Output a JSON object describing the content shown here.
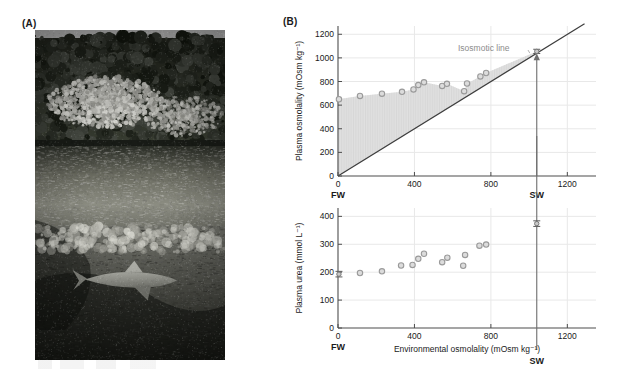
{
  "figure": {
    "panelA_label": "(A)",
    "panelB_label": "(B)"
  },
  "photo": {
    "alt_name": "bull-shark-in-mangrove-river-black-and-white-photograph",
    "scene": "Black and white photograph of a river lined with mangrove trees and palms, with a shark swimming below the water surface",
    "subject": "shark"
  },
  "chart_data": [
    {
      "id": "plasma-osmolality",
      "type": "scatter",
      "title": "",
      "xlabel": "",
      "ylabel": "Plasma osmolality (mOsm kg⁻¹)",
      "xlim": [
        0,
        1350
      ],
      "ylim": [
        0,
        1270
      ],
      "xticks": [
        0,
        400,
        800,
        1200
      ],
      "xticklabels": [
        "0",
        "400",
        "800",
        "1200"
      ],
      "yticks": [
        0,
        200,
        400,
        600,
        800,
        1000,
        1200
      ],
      "yticklabels": [
        "0",
        "200",
        "400",
        "600",
        "800",
        "1000",
        "1200"
      ],
      "grid": true,
      "legend": "none",
      "annotations": [
        {
          "text": "Isosmotic line",
          "x": 900,
          "y": 1075,
          "leader_to_x": 1035,
          "leader_to_y": 1040
        }
      ],
      "reference_lines": [
        {
          "name": "isosmotic-line",
          "type": "identity",
          "from": [
            0,
            0
          ],
          "to": [
            1290,
            1290
          ]
        }
      ],
      "shaded_region": {
        "name": "hyperosmotic-gap",
        "description": "Region between the isosmotic line and the measured plasma osmolality curve",
        "upper_x": [
          0,
          115,
          230,
          335,
          395,
          420,
          450,
          545,
          570,
          660,
          675,
          745,
          775,
          1040
        ],
        "upper_y": [
          650,
          678,
          697,
          713,
          733,
          770,
          793,
          763,
          780,
          718,
          783,
          843,
          872,
          1055
        ]
      },
      "series": [
        {
          "name": "Plasma osmolality",
          "x": [
            5,
            115,
            230,
            335,
            395,
            420,
            450,
            545,
            570,
            660,
            675,
            745,
            775
          ],
          "y": [
            650,
            678,
            697,
            713,
            733,
            770,
            793,
            763,
            780,
            718,
            783,
            843,
            872
          ]
        }
      ],
      "error_bar_points": [
        {
          "name": "SW-reference",
          "x": 1040,
          "y": 1055,
          "error": 18
        }
      ],
      "x_end_labels": [
        {
          "label": "FW",
          "x": 0
        },
        {
          "label": "SW",
          "x": 1040
        }
      ],
      "arrow": {
        "name": "sw-arrow",
        "x": 1040,
        "from_y": 0,
        "to_y": 1030
      }
    },
    {
      "id": "plasma-urea",
      "type": "scatter",
      "title": "",
      "xlabel": "Environmental osmolality (mOsm kg⁻¹)",
      "ylabel": "Plasma urea (mmol L⁻¹)",
      "xlim": [
        0,
        1350
      ],
      "ylim": [
        0,
        430
      ],
      "xticks": [
        0,
        400,
        800,
        1200
      ],
      "xticklabels": [
        "0",
        "400",
        "800",
        "1200"
      ],
      "yticks": [
        0,
        100,
        200,
        300,
        400
      ],
      "yticklabels": [
        "0",
        "100",
        "200",
        "300",
        "400"
      ],
      "grid": true,
      "legend": "none",
      "series": [
        {
          "name": "Plasma urea",
          "x": [
            115,
            230,
            330,
            390,
            420,
            450,
            545,
            572,
            655,
            665,
            740,
            775
          ],
          "y": [
            197,
            203,
            224,
            226,
            248,
            266,
            236,
            252,
            223,
            262,
            295,
            299
          ]
        }
      ],
      "error_bar_points": [
        {
          "name": "FW-reference",
          "x": 5,
          "y": 193,
          "error": 10
        },
        {
          "name": "SW-reference",
          "x": 1040,
          "y": 374,
          "error": 10
        }
      ],
      "x_end_labels": [
        {
          "label": "FW",
          "x": 0
        },
        {
          "label": "SW",
          "x": 1040
        }
      ],
      "vertical_line": {
        "name": "sw-line",
        "x": 1040
      }
    }
  ],
  "colors": {
    "axis": "#4d4d4d",
    "grid": "#e8e8e8",
    "marker_fill": "#dcdcdc",
    "marker_edge": "#9a9a9a",
    "shade": "#e2e2e2",
    "annotation": "#8c8c8c",
    "text": "#1a1a1a"
  }
}
